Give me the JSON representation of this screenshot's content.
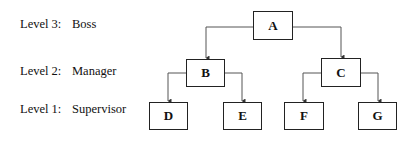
{
  "levels": [
    {
      "level": "Level 3:",
      "role": "Boss"
    },
    {
      "level": "Level 2:",
      "role": "Manager"
    },
    {
      "level": "Level 1:",
      "role": "Supervisor"
    }
  ],
  "nodes": {
    "A": "A",
    "B": "B",
    "C": "C",
    "D": "D",
    "E": "E",
    "F": "F",
    "G": "G"
  },
  "edges": [
    [
      "A",
      "B"
    ],
    [
      "A",
      "C"
    ],
    [
      "B",
      "D"
    ],
    [
      "B",
      "E"
    ],
    [
      "C",
      "F"
    ],
    [
      "C",
      "G"
    ]
  ],
  "colors": {
    "line": "#555555",
    "box_border": "#222222"
  }
}
